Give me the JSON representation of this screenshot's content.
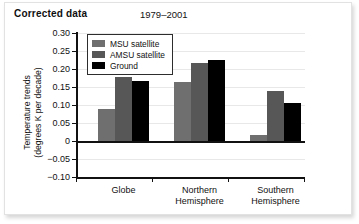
{
  "figure": {
    "corrected_label": "Corrected data",
    "period_title": "1979–2001"
  },
  "chart_data": {
    "type": "bar",
    "title": "1979–2001",
    "annotation": "Corrected data",
    "xlabel": "",
    "ylabel": "Temperature trends\n(degrees K per decade)",
    "categories": [
      "Globe",
      "Northern\nHemisphere",
      "Southern\nHemisphere"
    ],
    "series": [
      {
        "name": "MSU satellite",
        "color": "#6f6f6f",
        "values": [
          0.088,
          0.165,
          0.016
        ]
      },
      {
        "name": "AMSU satellite",
        "color": "#575757",
        "values": [
          0.178,
          0.218,
          0.138
        ]
      },
      {
        "name": "Ground",
        "color": "#000000",
        "values": [
          0.168,
          0.225,
          0.105
        ]
      }
    ],
    "ylim": [
      -0.1,
      0.3
    ],
    "yticks": [
      0.3,
      0.25,
      0.2,
      0.15,
      0.1,
      0.05,
      0,
      -0.05,
      -0.1
    ],
    "ytick_labels": [
      "0.30",
      "0.25",
      "0.20",
      "0.15",
      "0.10",
      "0.05",
      "0",
      "−0.05",
      "−0.10"
    ],
    "grid": true,
    "legend_position": "top-left"
  },
  "legend": {
    "items": [
      {
        "label": "MSU satellite",
        "key": "msu"
      },
      {
        "label": "AMSU satellite",
        "key": "amsu"
      },
      {
        "label": "Ground",
        "key": "ground"
      }
    ]
  }
}
